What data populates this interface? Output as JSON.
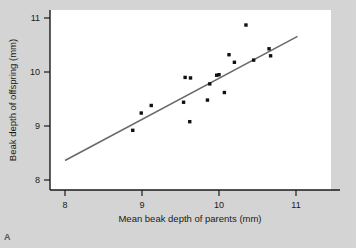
{
  "figure": {
    "panel_label": "A",
    "background_color": "#d4d4d4",
    "plot_background_color": "#ffffff",
    "axis_color": "#1a1a1a",
    "point_color": "#111111",
    "line_color": "#6a6a6a"
  },
  "chart_data": {
    "type": "scatter",
    "title": "",
    "xlabel": "Mean beak depth of parents (mm)",
    "ylabel": "Beak depth of offspring (mm)",
    "xlim": [
      7.7,
      11.3
    ],
    "ylim": [
      7.65,
      11.15
    ],
    "xticks": [
      8,
      9,
      10,
      11
    ],
    "xtick_labels": [
      "8",
      "9",
      "10",
      "11"
    ],
    "yticks": [
      8,
      9,
      10,
      11
    ],
    "ytick_labels": [
      "8",
      "9",
      "10",
      "11"
    ],
    "grid": false,
    "legend": "none",
    "x": [
      8.88,
      8.99,
      9.12,
      9.54,
      9.56,
      9.62,
      9.63,
      9.85,
      9.88,
      9.97,
      10.0,
      10.07,
      10.13,
      10.2,
      10.35,
      10.45,
      10.65,
      10.67
    ],
    "y": [
      8.92,
      9.24,
      9.38,
      9.44,
      9.9,
      9.08,
      9.89,
      9.48,
      9.78,
      9.94,
      9.95,
      9.62,
      10.32,
      10.18,
      10.87,
      10.22,
      10.43,
      10.3
    ],
    "series": [
      {
        "name": "offspring vs parent beak depth",
        "marker": "square-dot",
        "points": [
          [
            8.88,
            8.92
          ],
          [
            8.99,
            9.24
          ],
          [
            9.12,
            9.38
          ],
          [
            9.54,
            9.44
          ],
          [
            9.56,
            9.9
          ],
          [
            9.62,
            9.08
          ],
          [
            9.63,
            9.89
          ],
          [
            9.85,
            9.48
          ],
          [
            9.88,
            9.78
          ],
          [
            9.97,
            9.94
          ],
          [
            10.0,
            9.95
          ],
          [
            10.07,
            9.62
          ],
          [
            10.13,
            10.32
          ],
          [
            10.2,
            10.18
          ],
          [
            10.35,
            10.87
          ],
          [
            10.45,
            10.22
          ],
          [
            10.65,
            10.43
          ],
          [
            10.67,
            10.3
          ]
        ]
      }
    ],
    "trendline": {
      "type": "linear-regression",
      "x_start": 8.0,
      "y_start": 8.36,
      "x_end": 11.02,
      "y_end": 10.66
    }
  }
}
